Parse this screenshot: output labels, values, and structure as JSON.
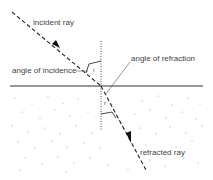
{
  "diagram": {
    "type": "refraction",
    "labels": {
      "incident_ray": "incident ray",
      "angle_of_incidence": "angle of incidence",
      "angle_of_refraction": "angle of refraction",
      "refracted_ray": "refracted ray",
      "angle_i_symbol": "i",
      "angle_r_symbol": "r"
    },
    "colors": {
      "line": "#222222",
      "text": "#444444",
      "speckle": "#9a9a9a"
    }
  }
}
